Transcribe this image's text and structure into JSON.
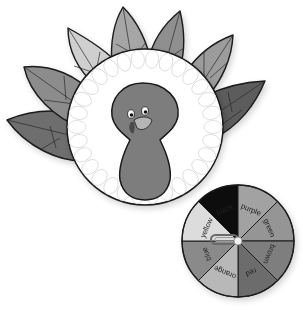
{
  "illustration": {
    "subject": "turkey-craft-color-spinner",
    "colors": {
      "outline": "#1a1a1a",
      "background": "#ffffff",
      "body": "#7d7d7d",
      "plate": "#ffffff",
      "plate_scallop": "#e6e6e6"
    },
    "feathers": [
      {
        "name": "feather-far-left",
        "fill": "#6e6e6e"
      },
      {
        "name": "feather-left",
        "fill": "#8c8c8c"
      },
      {
        "name": "feather-upper-left",
        "fill": "#cfcfcf"
      },
      {
        "name": "feather-top-left",
        "fill": "#a6a6a6"
      },
      {
        "name": "feather-top-right",
        "fill": "#8f8f8f"
      },
      {
        "name": "feather-upper-right",
        "fill": "#9c9c9c"
      },
      {
        "name": "feather-right",
        "fill": "#5c5c5c"
      }
    ]
  },
  "spinner": {
    "segments": [
      {
        "label": "black",
        "fill": "#0d0d0d",
        "text_fill": "#ffffff"
      },
      {
        "label": "purple",
        "fill": "#a2a2a2",
        "text_fill": "#222222"
      },
      {
        "label": "green",
        "fill": "#959595",
        "text_fill": "#222222"
      },
      {
        "label": "brown",
        "fill": "#7e7e7e",
        "text_fill": "#222222"
      },
      {
        "label": "red",
        "fill": "#6c6c6c",
        "text_fill": "#222222"
      },
      {
        "label": "orange",
        "fill": "#b8b8b8",
        "text_fill": "#222222"
      },
      {
        "label": "blue",
        "fill": "#8a8a8a",
        "text_fill": "#222222"
      },
      {
        "label": "yellow",
        "fill": "#dcdcdc",
        "text_fill": "#222222"
      }
    ]
  }
}
